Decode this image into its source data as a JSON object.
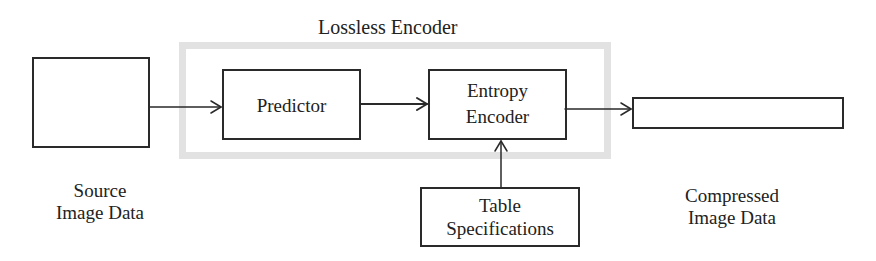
{
  "diagram": {
    "title": "Lossless Encoder",
    "nodes": {
      "source": {
        "label_line1": "Source",
        "label_line2": "Image Data"
      },
      "predictor": {
        "label": "Predictor"
      },
      "entropy": {
        "label_line1": "Entropy",
        "label_line2": "Encoder"
      },
      "table": {
        "label_line1": "Table",
        "label_line2": "Specifications"
      },
      "compressed": {
        "label_line1": "Compressed",
        "label_line2": "Image Data"
      }
    },
    "edges": [
      {
        "from": "source",
        "to": "predictor"
      },
      {
        "from": "predictor",
        "to": "entropy"
      },
      {
        "from": "entropy",
        "to": "compressed"
      },
      {
        "from": "table",
        "to": "entropy"
      }
    ],
    "colors": {
      "line": "#2a2a2a",
      "encoder_frame": "#e2e2e2"
    }
  }
}
